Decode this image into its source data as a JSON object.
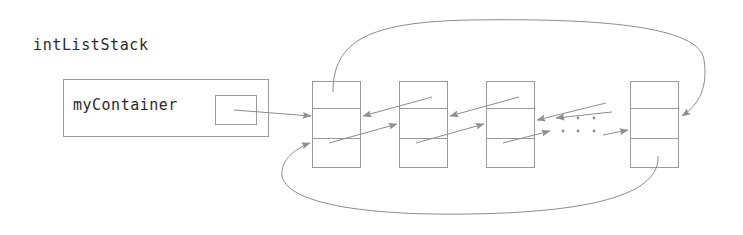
{
  "diagram": {
    "title_label": "intListStack",
    "field_label": "myContainer",
    "ellipsis_glyph": "·",
    "colors": {
      "stroke": "#8c8c8c",
      "box_stroke": "#9a9a9a",
      "arrow_fill": "#8f8f8f",
      "text": "#2b2b2b",
      "background": "#ffffff"
    },
    "object_box": {
      "name": "intListStack-object-box",
      "x": 63,
      "y": 79,
      "width": 205,
      "height": 57
    },
    "pointer_slot": {
      "name": "myContainer-pointer-slot",
      "x": 215,
      "y": 95,
      "width": 41,
      "height": 29
    },
    "nodes": [
      {
        "name": "list-node-1",
        "x": 312,
        "y": 81,
        "width": 48,
        "height": 86
      },
      {
        "name": "list-node-2",
        "x": 399,
        "y": 81,
        "width": 48,
        "height": 86
      },
      {
        "name": "list-node-3",
        "x": 486,
        "y": 81,
        "width": 48,
        "height": 86
      },
      {
        "name": "list-node-4",
        "x": 630,
        "y": 81,
        "width": 48,
        "height": 86
      }
    ],
    "node_divider_offsets": [
      27,
      57
    ],
    "ellipsis_rows": [
      {
        "name": "ellipsis-upper",
        "y": 118,
        "dots_x": [
          563,
          578,
          594
        ]
      },
      {
        "name": "ellipsis-lower",
        "y": 131,
        "dots_x": [
          563,
          578,
          594
        ]
      }
    ]
  }
}
